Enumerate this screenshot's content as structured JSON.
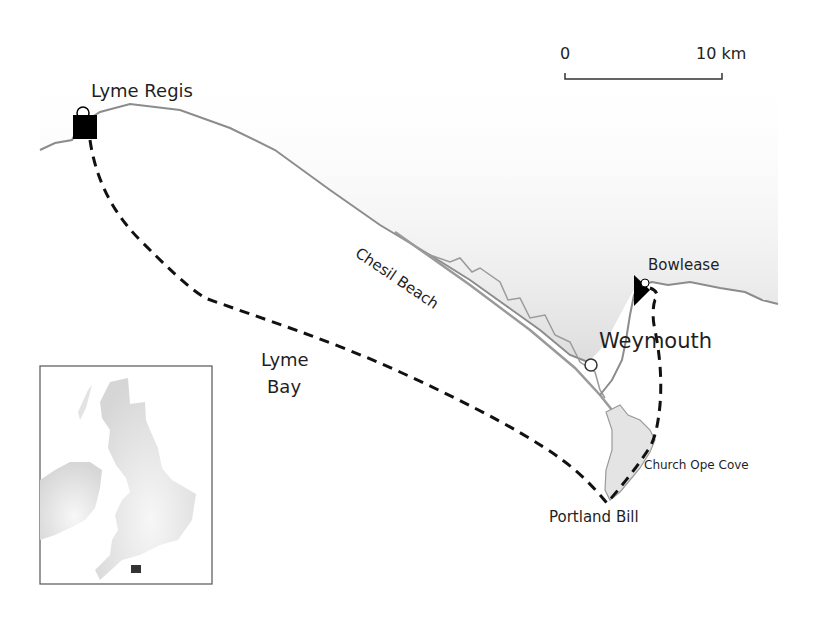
{
  "map": {
    "title": "",
    "colors": {
      "land": "#e6e6e6",
      "coast_line": "#8c8c8c",
      "route": "#111111",
      "marker": "#000000",
      "inset_border": "#555555"
    },
    "scale_bar": {
      "start_label": "0",
      "end_label": "10 km"
    },
    "labels": {
      "lyme_regis": "Lyme Regis",
      "chesil_beach": "Chesil Beach",
      "bowlease": "Bowlease",
      "weymouth": "Weymouth",
      "lyme_bay_line1": "Lyme",
      "lyme_bay_line2": "Bay",
      "church_ope_cove": "Church Ope Cove",
      "portland_bill": "Portland Bill"
    },
    "markers": [
      {
        "name": "Lyme Regis",
        "symbol": "filled-square"
      },
      {
        "name": "Bowlease",
        "symbol": "filled-triangle"
      },
      {
        "name": "Weymouth",
        "symbol": "open-circle"
      }
    ],
    "route": {
      "style": "dashed",
      "waypoints": [
        "Lyme Regis",
        "Lyme Bay",
        "Portland Bill",
        "Church Ope Cove",
        "Weymouth",
        "Bowlease"
      ]
    },
    "inset": {
      "description": "British Isles locator map",
      "highlight": "study area (south Dorset coast)"
    }
  }
}
